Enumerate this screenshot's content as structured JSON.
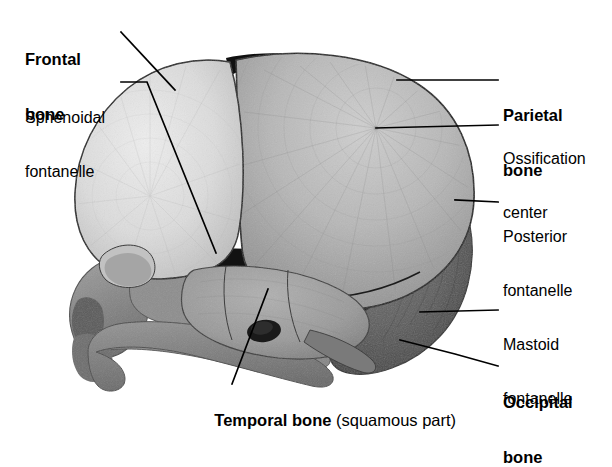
{
  "figure": {
    "view": "lateral",
    "background_color": "#ffffff",
    "line_color": "#000000"
  },
  "labels": [
    {
      "id": "frontal-bone",
      "text": "Frontal\nbone",
      "style": "bold",
      "x": 25,
      "y": 13,
      "align": "left",
      "leader": "M 121,32 L 175,90"
    },
    {
      "id": "sphenoidal-fontanelle",
      "text": "Sphenoidal\nfontanelle",
      "style": "regular",
      "x": 25,
      "y": 73,
      "align": "left",
      "leader": "M 121,82 L 147,82 L 216,253"
    },
    {
      "id": "parietal-bone",
      "text": "Parietal\nbone",
      "style": "bold",
      "x": 503,
      "y": 69,
      "align": "left",
      "leader": "M 498,80 L 397,80"
    },
    {
      "id": "ossification-center",
      "text": "Ossification\ncenter",
      "style": "regular",
      "x": 503,
      "y": 114,
      "align": "left",
      "leader": "M 498,125 L 376,128"
    },
    {
      "id": "posterior-fontanelle",
      "text": "Posterior\nfontanelle",
      "style": "regular",
      "x": 503,
      "y": 192,
      "align": "left",
      "leader": "M 498,202 L 455,200"
    },
    {
      "id": "mastoid-fontanelle",
      "text": "Mastoid\nfontanelle",
      "style": "regular",
      "x": 503,
      "y": 300,
      "align": "left",
      "leader": "M 498,310 L 420,312"
    },
    {
      "id": "occipital-bone",
      "text": "Occipital\nbone",
      "style": "bold",
      "x": 503,
      "y": 356,
      "align": "left",
      "leader": "M 498,366 L 455,354 L 400,340"
    },
    {
      "id": "temporal-bone",
      "text_bold": "Temporal bone",
      "text_regular": " (squamous part)",
      "style": "mixed",
      "x": 196,
      "y": 393,
      "align": "left",
      "leader": "M 232,384 L 268,289"
    }
  ],
  "anatomy": {
    "regions": [
      {
        "name": "frontal-bone",
        "fill": "#dcdcdc",
        "description": "light gray anterior dome, radiating striations"
      },
      {
        "name": "parietal-bone",
        "fill": "#b5b5b5",
        "description": "medium gray large posterior-superior dome with ossification center"
      },
      {
        "name": "occipital-bone",
        "fill": "#5e5e5e",
        "description": "dark gray postero-inferior bone"
      },
      {
        "name": "temporal-bone-squamous",
        "fill": "#9c9c9c",
        "description": "mid gray squamous part with external acoustic meatus"
      },
      {
        "name": "facial-bones",
        "fill": "#8a8a8a",
        "description": "darker gray orbit, maxilla, zygomatic arch, mandible"
      },
      {
        "name": "mandible",
        "fill": "#7d7d7d",
        "description": "dark gray lower jaw"
      },
      {
        "name": "anterior-fontanelle",
        "fill": "#111111",
        "description": "black wedge at frontal/parietal apex"
      },
      {
        "name": "sphenoidal-fontanelle",
        "fill": "#101010",
        "description": "black gap anterolateral, pterion region"
      },
      {
        "name": "posterior-fontanelle",
        "fill": "#0f0f0f",
        "description": "black gap at parietal/occipital junction"
      },
      {
        "name": "mastoid-fontanelle",
        "fill": "#0d0d0d",
        "description": "black gap posteroinferior"
      }
    ],
    "ossification_center": {
      "x": 376,
      "y": 128
    },
    "external_acoustic_meatus": {
      "x": 264,
      "y": 331
    }
  }
}
